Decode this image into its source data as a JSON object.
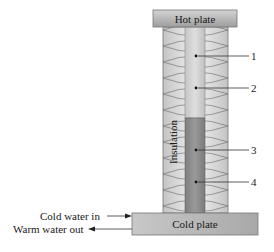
{
  "diagram": {
    "hot_plate": {
      "label": "Hot plate"
    },
    "cold_plate": {
      "label": "Cold plate"
    },
    "insulation": {
      "label": "Insulation"
    },
    "points": [
      {
        "id": "1",
        "label": "1"
      },
      {
        "id": "2",
        "label": "2"
      },
      {
        "id": "3",
        "label": "3"
      },
      {
        "id": "4",
        "label": "4"
      }
    ],
    "flows": {
      "inlet": "Cold water in",
      "outlet": "Warm water out"
    },
    "colors": {
      "plate_fill": "#b5b5b5",
      "upper_rod": "#d2d2d2",
      "lower_rod": "#8e8e8e",
      "insulation": "#e4e4e4",
      "line": "#333333"
    }
  }
}
